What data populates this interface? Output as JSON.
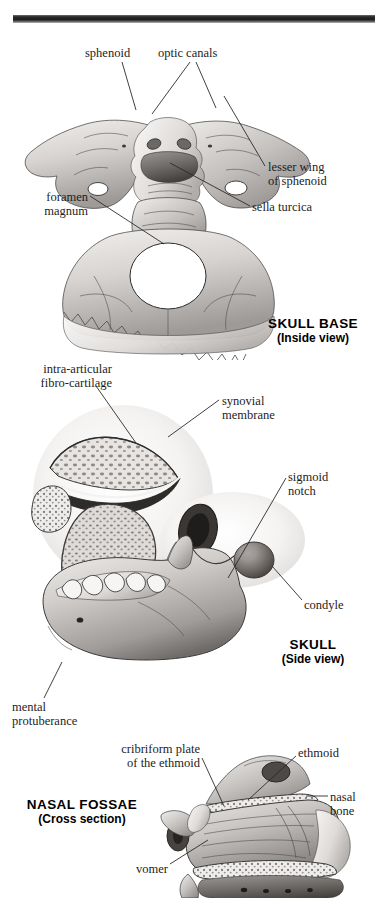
{
  "page": {
    "background_color": "#ffffff",
    "ink_color": "#1d1d1d",
    "top_rule_color": "#1c1c1c"
  },
  "figures": [
    {
      "id": "skull-base",
      "section_title": "SKULL BASE",
      "section_subtitle": "(Inside view)",
      "labels": [
        {
          "name": "sphenoid",
          "text": "sphenoid"
        },
        {
          "name": "optic-canals",
          "text": "optic canals"
        },
        {
          "name": "lesser-wing-of-sphenoid",
          "text": "lesser wing\nof sphenoid"
        },
        {
          "name": "sella-turcica",
          "text": "sella turcica"
        },
        {
          "name": "foramen-magnum",
          "text": "foramen\nmagnum"
        }
      ]
    },
    {
      "id": "skull-side",
      "section_title": "SKULL",
      "section_subtitle": "(Side view)",
      "labels": [
        {
          "name": "intra-articular-fibro-cartilage",
          "text": "intra-articular\nfibro-cartilage"
        },
        {
          "name": "synovial-membrane",
          "text": "synovial\nmembrane"
        },
        {
          "name": "sigmoid-notch",
          "text": "sigmoid\nnotch"
        },
        {
          "name": "condyle",
          "text": "condyle"
        },
        {
          "name": "mental-protuberance",
          "text": "mental\nprotuberance"
        }
      ]
    },
    {
      "id": "nasal-fossae",
      "section_title": "NASAL FOSSAE",
      "section_subtitle": "(Cross section)",
      "labels": [
        {
          "name": "cribriform-plate-of-the-ethmoid",
          "text": "cribriform plate\nof the ethmoid"
        },
        {
          "name": "ethmoid",
          "text": "ethmoid"
        },
        {
          "name": "nasal-bone",
          "text": "nasal\nbone"
        },
        {
          "name": "vomer",
          "text": "vomer"
        }
      ]
    }
  ]
}
